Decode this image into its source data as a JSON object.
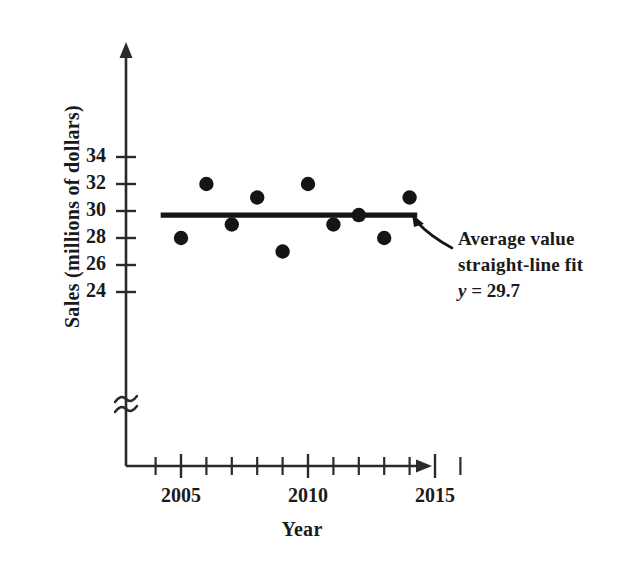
{
  "chart_data": {
    "type": "scatter",
    "title": "",
    "xlabel": "Year",
    "ylabel": "Sales (millions of dollars)",
    "x": [
      2005,
      2006,
      2007,
      2008,
      2009,
      2010,
      2011,
      2012,
      2013,
      2014
    ],
    "values": [
      28,
      32,
      29,
      31,
      27,
      32,
      29,
      29.7,
      28,
      31
    ],
    "series": [
      {
        "name": "Sales",
        "values": [
          28,
          32,
          29,
          31,
          27,
          32,
          29,
          29.7,
          28,
          31
        ]
      }
    ],
    "xlim": [
      2003.5,
      2016.5
    ],
    "ylim": [
      23,
      35
    ],
    "ytick_labels": [
      "34",
      "32",
      "30",
      "28",
      "26",
      "24"
    ],
    "ytick_values": [
      34,
      32,
      30,
      28,
      26,
      24
    ],
    "xtick_labels": [
      "2005",
      "2010",
      "2015"
    ],
    "xtick_values": [
      2005,
      2010,
      2015
    ],
    "xtick_minor_values": [
      2004,
      2006,
      2007,
      2008,
      2009,
      2011,
      2012,
      2013,
      2014,
      2016
    ],
    "grid": false,
    "legend": "none",
    "axis_break": "≈",
    "trendline": {
      "type": "horizontal",
      "y": 29.7,
      "x_start": 2004.2,
      "x_end": 2014.3
    },
    "annotations": [
      {
        "line1": "Average value",
        "line2": "straight-line fit",
        "equation_var": "y",
        "equation_eq": "=",
        "equation_value": "29.7"
      }
    ],
    "colors": {
      "marker": "#151515",
      "line": "#151515",
      "axis": "#2a2a2a",
      "text": "#1a1a1a",
      "background": "#ffffff"
    }
  },
  "axis": {
    "y_title": "Sales (millions of dollars)",
    "x_title": "Year"
  },
  "annotation": {
    "line1": "Average value",
    "line2": "straight-line fit",
    "equation_var": "y",
    "equation_rest": " = 29.7"
  }
}
